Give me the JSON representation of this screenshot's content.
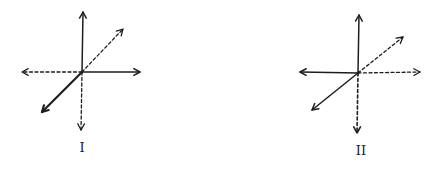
{
  "colors": {
    "stroke": "#1e1e1e",
    "background": "#ffffff"
  },
  "figures": [
    {
      "label": "I",
      "label_pos": [
        82,
        152
      ],
      "origin": [
        82,
        72
      ],
      "arrows": [
        {
          "name": "up",
          "to": [
            83,
            12
          ],
          "style": "solid",
          "width": 1.5
        },
        {
          "name": "right",
          "to": [
            140,
            72
          ],
          "style": "solid",
          "width": 1.5
        },
        {
          "name": "up-right",
          "to": [
            123,
            29
          ],
          "style": "dashed",
          "width": 1.3
        },
        {
          "name": "left",
          "to": [
            22,
            72
          ],
          "style": "dashed",
          "width": 1.3
        },
        {
          "name": "down",
          "to": [
            81,
            130
          ],
          "style": "dashed",
          "width": 1.3
        },
        {
          "name": "down-left",
          "to": [
            42,
            112
          ],
          "style": "solid",
          "width": 2.2
        }
      ]
    },
    {
      "label": "II",
      "label_pos": [
        361,
        155
      ],
      "origin": [
        358,
        73
      ],
      "arrows": [
        {
          "name": "up",
          "to": [
            359,
            15
          ],
          "style": "solid",
          "width": 1.5
        },
        {
          "name": "left",
          "to": [
            300,
            72
          ],
          "style": "solid",
          "width": 1.5
        },
        {
          "name": "up-right",
          "to": [
            403,
            37
          ],
          "style": "dashed",
          "width": 1.3
        },
        {
          "name": "right",
          "to": [
            420,
            72
          ],
          "style": "dashed",
          "width": 1.3
        },
        {
          "name": "down",
          "to": [
            357,
            133
          ],
          "style": "dashed",
          "width": 1.6
        },
        {
          "name": "down-left",
          "to": [
            312,
            110
          ],
          "style": "solid",
          "width": 1.5
        }
      ]
    }
  ]
}
